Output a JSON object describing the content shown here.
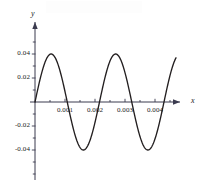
{
  "figure": {
    "width": 203,
    "height": 189,
    "background": "#ffffff",
    "curve_color": "#231f20",
    "axis_color": "#3b3b4f"
  },
  "axes": {
    "x_axis_label": "x",
    "y_axis_label": "y",
    "origin_px": {
      "x": 35,
      "y": 102
    },
    "x_px_per_unit": 30000,
    "y_px_per_unit": 1200,
    "x_axis_start_px": 30,
    "x_axis_end_px": 186,
    "y_axis_top_px": 20,
    "y_axis_bottom_px": 180
  },
  "chart_data": {
    "type": "line",
    "title": "",
    "xlabel": "x",
    "ylabel": "y",
    "xlim": [
      -0.00017,
      0.005
    ],
    "ylim": [
      -0.0683,
      0.0683
    ],
    "grid": false,
    "legend": null,
    "xticks": [
      0.001,
      0.002,
      0.003,
      0.004
    ],
    "xtick_labels": [
      "0.001",
      "0.002",
      "0.003",
      "0.004"
    ],
    "yticks": [
      0.04,
      0.02,
      -0.02,
      -0.04
    ],
    "ytick_labels": [
      "0.04",
      "0.02",
      "-0.02",
      "-0.04"
    ],
    "minor_xticks": [
      0.0005,
      0.0015,
      0.0025,
      0.0035,
      0.0045
    ],
    "minor_yticks": [
      0.05,
      0.03,
      0.01,
      -0.01,
      -0.03,
      -0.05,
      -0.06
    ],
    "series": [
      {
        "name": "y",
        "description": "sinusoid of amplitude 0.04 and period 0.00215 starting at the origin",
        "amplitude": 0.04,
        "period": 0.00215,
        "phase": 0,
        "x": [
          0.0,
          0.0001,
          0.0002,
          0.0003,
          0.0004,
          0.0005,
          0.0006,
          0.0007,
          0.0008,
          0.0009,
          0.001,
          0.0011,
          0.0012,
          0.0013,
          0.0014,
          0.0015,
          0.0016,
          0.0017,
          0.0018,
          0.0019,
          0.002,
          0.0021,
          0.0022,
          0.0023,
          0.0024,
          0.0025,
          0.0026,
          0.0027,
          0.0028,
          0.0029,
          0.003,
          0.0031,
          0.0032,
          0.0033,
          0.0034,
          0.0035,
          0.0036,
          0.0037,
          0.0038,
          0.0039,
          0.004,
          0.0041,
          0.0042,
          0.0043,
          0.0044,
          0.0045,
          0.0046,
          0.0047
        ],
        "y": [
          0.0,
          0.0114,
          0.0218,
          0.0303,
          0.0361,
          0.0394,
          0.0398,
          0.0373,
          0.0321,
          0.0246,
          0.0153,
          0.0049,
          -0.0059,
          -0.0163,
          -0.0256,
          -0.0328,
          -0.0376,
          -0.0397,
          -0.0389,
          -0.0353,
          -0.0291,
          -0.0208,
          -0.0109,
          -0.0001,
          0.0107,
          0.0207,
          0.0291,
          0.0353,
          0.0389,
          0.0397,
          0.0376,
          0.0328,
          0.0256,
          0.0163,
          0.0059,
          -0.0049,
          -0.0153,
          -0.0246,
          -0.0321,
          -0.0373,
          -0.0398,
          -0.0394,
          -0.0361,
          -0.0303,
          -0.0218,
          -0.0114,
          0.0,
          0.0114
        ],
        "maxima": [
          {
            "x": 0.0006,
            "y": 0.04
          },
          {
            "x": 0.00285,
            "y": 0.04
          }
        ],
        "minima": [
          {
            "x": 0.00168,
            "y": -0.04
          },
          {
            "x": 0.00393,
            "y": -0.04
          }
        ],
        "zero_crossings": [
          0.0,
          0.001075,
          0.00215,
          0.003225,
          0.0043
        ]
      }
    ]
  }
}
